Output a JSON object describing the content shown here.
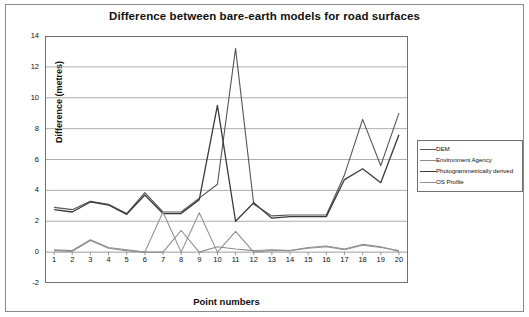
{
  "chart_data": {
    "type": "line",
    "title": "Difference between bare-earth models for road surfaces",
    "xlabel": "Point numbers",
    "ylabel": "Difference (metres)",
    "categories": [
      1,
      2,
      3,
      4,
      5,
      6,
      7,
      8,
      9,
      10,
      11,
      12,
      13,
      14,
      15,
      16,
      17,
      18,
      19,
      20
    ],
    "x_tick_labels": [
      "1",
      "2",
      "3",
      "4",
      "5",
      "6",
      "7",
      "8",
      "9",
      "10",
      "11",
      "12",
      "13",
      "14",
      "15",
      "16",
      "17",
      "18",
      "19",
      "20"
    ],
    "y_tick_labels": [
      "-2",
      "0",
      "2",
      "4",
      "6",
      "8",
      "10",
      "12",
      "14"
    ],
    "ylim": [
      -2,
      14
    ],
    "y_ticks": [
      -2,
      0,
      2,
      4,
      6,
      8,
      10,
      12,
      14
    ],
    "grid": true,
    "grid_axis": "y",
    "legend_position": "right",
    "series": [
      {
        "name": "DEM",
        "color": "#555555",
        "width": 1.1,
        "values": [
          2.9,
          2.75,
          3.3,
          3.1,
          2.5,
          3.85,
          2.6,
          2.6,
          3.5,
          4.4,
          13.2,
          3.1,
          2.35,
          2.4,
          2.4,
          2.4,
          5.0,
          8.6,
          5.6,
          9.0
        ]
      },
      {
        "name": "Environment Agency",
        "color": "#8c8c8c",
        "width": 1.1,
        "values": [
          0.1,
          0.05,
          0.75,
          0.25,
          0.1,
          0.0,
          0.0,
          1.4,
          0.0,
          0.35,
          0.2,
          0.1,
          0.15,
          0.1,
          0.3,
          0.4,
          0.2,
          0.5,
          0.35,
          0.05
        ]
      },
      {
        "name": "Photogrammetrically derived",
        "color": "#3a3a3a",
        "width": 1.3,
        "values": [
          2.75,
          2.6,
          3.25,
          3.05,
          2.45,
          3.7,
          2.5,
          2.5,
          3.4,
          9.5,
          2.0,
          3.2,
          2.2,
          2.3,
          2.3,
          2.3,
          4.7,
          5.4,
          4.5,
          7.6
        ]
      },
      {
        "name": "OS Profile",
        "color": "#909090",
        "width": 1.1,
        "values": [
          0.15,
          0.1,
          0.8,
          0.3,
          0.15,
          0.0,
          2.6,
          0.0,
          2.55,
          0.0,
          1.35,
          0.0,
          0.1,
          0.1,
          0.25,
          0.35,
          0.15,
          0.45,
          0.3,
          0.1
        ]
      }
    ]
  }
}
